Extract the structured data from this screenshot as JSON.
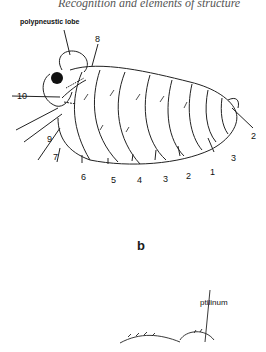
{
  "running_head": "Recognition and elements of structure",
  "figure_a": {
    "labels": {
      "polypneustic_lobe": "polypneustic lobe",
      "n8": "8",
      "n10": "10",
      "n9": "9",
      "n7": "7",
      "n6": "6",
      "n5": "5",
      "n4": "4",
      "n3a": "3",
      "n2a": "2",
      "n1": "1",
      "n3b": "3",
      "n2b": "2"
    }
  },
  "figure_b": {
    "panel_letter": "b",
    "labels": {
      "ptilinum": "ptilinum"
    }
  }
}
